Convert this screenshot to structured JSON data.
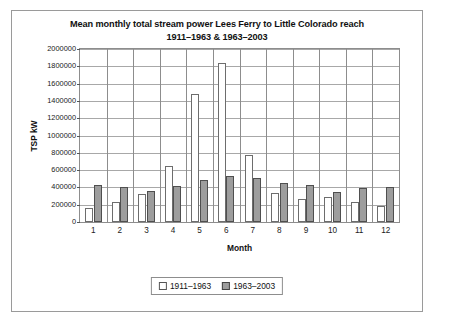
{
  "chart_data": {
    "type": "bar",
    "title": "Mean monthly total stream power Lees Ferry to Little Colorado reach 1911–1963 & 1963–2003",
    "title_lines": [
      "Mean monthly total stream power Lees Ferry to Little Colorado reach",
      "1911–1963 & 1963–2003"
    ],
    "xlabel": "Month",
    "ylabel": "TSP kW",
    "categories": [
      "1",
      "2",
      "3",
      "4",
      "5",
      "6",
      "7",
      "8",
      "9",
      "10",
      "11",
      "12"
    ],
    "ylim": [
      0,
      2000000
    ],
    "ytick_step": 200000,
    "yticks": [
      "2000000",
      "1800000",
      "1600000",
      "1400000",
      "1200000",
      "1000000",
      "800000",
      "600000",
      "400000",
      "200000",
      "0"
    ],
    "grid": true,
    "legend_position": "bottom-center",
    "series": [
      {
        "name": "1911–1963",
        "color": "#ffffff",
        "edge_color": "#6d6d6d",
        "values": [
          160000,
          230000,
          320000,
          650000,
          1480000,
          1840000,
          770000,
          340000,
          270000,
          290000,
          230000,
          180000
        ]
      },
      {
        "name": "1963–2003",
        "color": "#9d9d9d",
        "edge_color": "#4f4f4f",
        "values": [
          430000,
          400000,
          360000,
          420000,
          480000,
          530000,
          510000,
          450000,
          430000,
          350000,
          390000,
          400000
        ]
      }
    ]
  }
}
